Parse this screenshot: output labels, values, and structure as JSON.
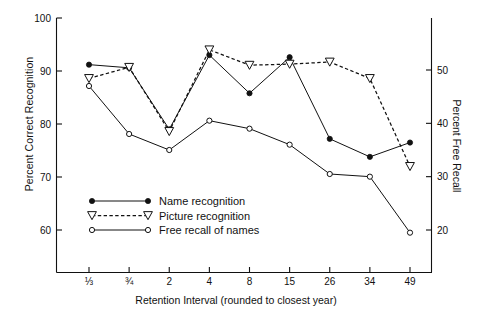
{
  "chart_data": {
    "type": "line",
    "title": "",
    "xlabel": "Retention Interval (rounded to closest year)",
    "ylabel": "Percent Correct Recognition",
    "ylabel_right": "Percent Free Recall",
    "categories": [
      "⅓",
      "¾",
      "2",
      "4",
      "8",
      "15",
      "26",
      "34",
      "49"
    ],
    "ylim": [
      55,
      100
    ],
    "yticks": [
      60,
      70,
      80,
      90,
      100
    ],
    "ylim_right": [
      16,
      57
    ],
    "yticks_right": [
      20,
      30,
      40,
      50
    ],
    "grid": false,
    "legend_position": "lower-left-inside",
    "series": [
      {
        "name": "Name recognition",
        "axis": "left",
        "marker": "filled-circle",
        "linestyle": "solid",
        "values": [
          91.2,
          90.6,
          79.0,
          93.0,
          85.8,
          92.6,
          77.2,
          73.8,
          76.5
        ]
      },
      {
        "name": "Picture recognition",
        "axis": "left",
        "marker": "open-triangle-down",
        "linestyle": "dashed",
        "values": [
          88.6,
          90.7,
          78.6,
          94.0,
          91.1,
          91.3,
          91.7,
          88.6,
          72.0
        ]
      },
      {
        "name": "Free recall of names",
        "axis": "right",
        "marker": "open-circle",
        "linestyle": "solid",
        "values": [
          47.0,
          38.0,
          35.0,
          40.5,
          39.0,
          36.0,
          30.5,
          30.0,
          19.5
        ]
      }
    ]
  },
  "legend": {
    "items": [
      {
        "label": "Name recognition"
      },
      {
        "label": "Picture recognition"
      },
      {
        "label": "Free recall of names"
      }
    ]
  },
  "axes": {
    "left_ticks": [
      "100",
      "90",
      "80",
      "70",
      "60"
    ],
    "right_ticks": [
      "50",
      "40",
      "30",
      "20"
    ],
    "x_ticks": [
      "⅓",
      "¾",
      "2",
      "4",
      "8",
      "15",
      "26",
      "34",
      "49"
    ],
    "left_title": "Percent Correct Recognition",
    "right_title": "Percent Free Recall",
    "x_title": "Retention Interval (rounded to closest year)"
  },
  "style": {
    "line_color": "#111111",
    "background": "#ffffff"
  }
}
